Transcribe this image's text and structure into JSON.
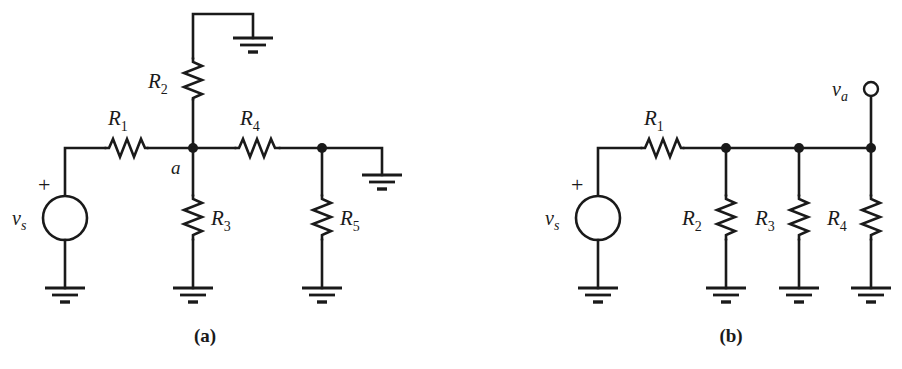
{
  "figure": {
    "background_color": "#ffffff",
    "ink_color": "#1a1a1a",
    "type": "circuit-schematic-pair"
  },
  "circuit_a": {
    "caption": "(a)",
    "source": {
      "symbol": "voltage-source",
      "label_base": "v",
      "label_sub": "s",
      "polarity": "+"
    },
    "node_label": "a",
    "resistors": [
      {
        "id": "R1",
        "base": "R",
        "sub": "1",
        "orientation": "horizontal"
      },
      {
        "id": "R2",
        "base": "R",
        "sub": "2",
        "orientation": "vertical"
      },
      {
        "id": "R3",
        "base": "R",
        "sub": "3",
        "orientation": "vertical"
      },
      {
        "id": "R4",
        "base": "R",
        "sub": "4",
        "orientation": "horizontal"
      },
      {
        "id": "R5",
        "base": "R",
        "sub": "5",
        "orientation": "vertical"
      }
    ],
    "grounds": 5
  },
  "circuit_b": {
    "caption": "(b)",
    "source": {
      "symbol": "voltage-source",
      "label_base": "v",
      "label_sub": "s",
      "polarity": "+"
    },
    "output_terminal": {
      "base": "v",
      "sub": "a",
      "symbol": "open-circle"
    },
    "resistors": [
      {
        "id": "R1",
        "base": "R",
        "sub": "1",
        "orientation": "horizontal"
      },
      {
        "id": "R2",
        "base": "R",
        "sub": "2",
        "orientation": "vertical"
      },
      {
        "id": "R3",
        "base": "R",
        "sub": "3",
        "orientation": "vertical"
      },
      {
        "id": "R4",
        "base": "R",
        "sub": "4",
        "orientation": "vertical"
      }
    ],
    "grounds": 4
  }
}
